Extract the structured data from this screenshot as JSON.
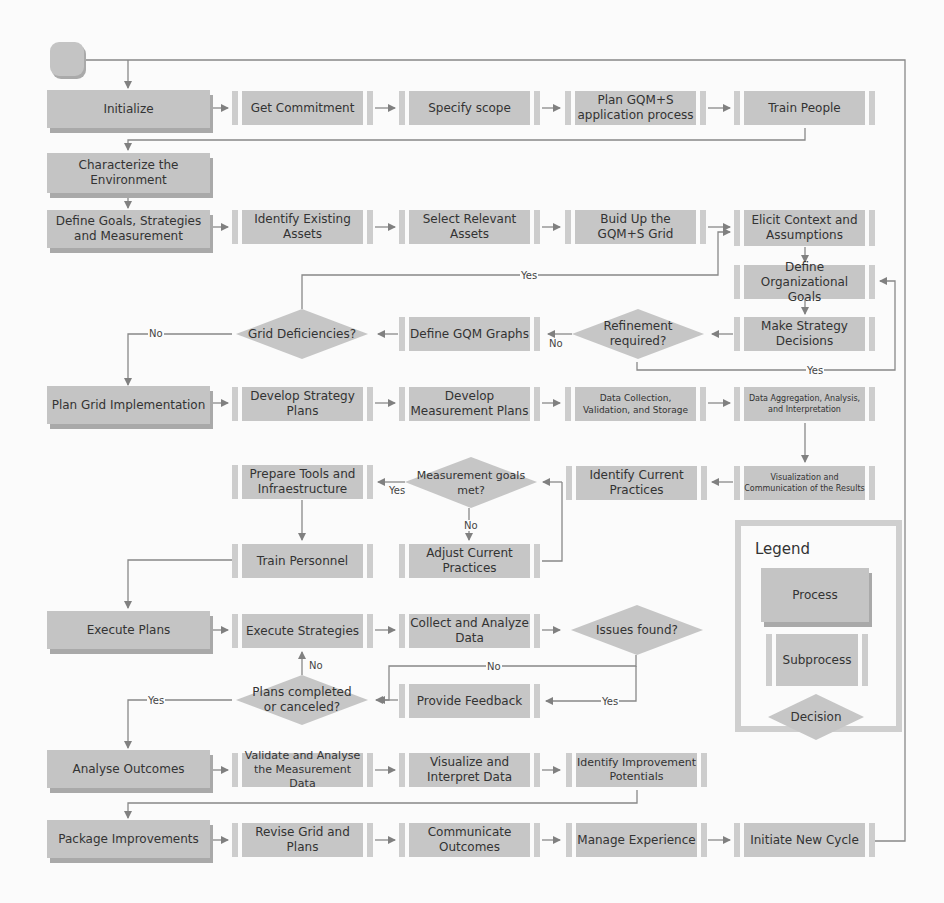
{
  "diagram": {
    "type": "flowchart"
  },
  "processes": {
    "initialize": "Initialize",
    "characterize": "Characterize the Environment",
    "define_goals": "Define Goals, Strategies and Measurement",
    "plan_grid": "Plan Grid Implementation",
    "execute_plans": "Execute Plans",
    "analyse_outcomes": "Analyse Outcomes",
    "package_improvements": "Package Improvements"
  },
  "subprocesses": {
    "get_commitment": "Get Commitment",
    "specify_scope": "Specify scope",
    "plan_gqm": "Plan GQM+S application process",
    "train_people": "Train People",
    "identify_assets": "Identify Existing Assets",
    "select_assets": "Select Relevant Assets",
    "build_grid": "Buid Up the GQM+S Grid",
    "elicit_context": "Elicit Context and Assumptions",
    "define_org_goals": "Define Organizational Goals",
    "make_strategy": "Make Strategy Decisions",
    "define_gqm_graphs": "Define GQM Graphs",
    "develop_strategy_plans": "Develop Strategy Plans",
    "develop_measurement_plans": "Develop Measurement Plans",
    "data_collection": "Data Collection, Validation, and Storage",
    "data_aggregation": "Data Aggregation, Analysis, and Interpretation",
    "visualization": "Visualization and Communication of the Results",
    "identify_practices": "Identify Current Practices",
    "prepare_tools": "Prepare Tools and Infraestructure",
    "train_personnel": "Train Personnel",
    "adjust_practices": "Adjust Current Practices",
    "execute_strategies": "Execute Strategies",
    "collect_analyze": "Collect and Analyze Data",
    "provide_feedback": "Provide Feedback",
    "validate_analyse": "Validate and Analyse the Measurement Data",
    "visualize_interpret": "Visualize and Interpret Data",
    "identify_improvement": "Identify Improvement Potentials",
    "revise_grid": "Revise Grid and Plans",
    "communicate_outcomes": "Communicate Outcomes",
    "manage_experience": "Manage Experience",
    "initiate_cycle": "Initiate New Cycle"
  },
  "decisions": {
    "grid_deficiencies": "Grid Deficiencies?",
    "refinement_required": "Refinement required?",
    "measurement_goals_met": "Measurement goals met?",
    "issues_found": "Issues found?",
    "plans_completed": "Plans completed or canceled?"
  },
  "edge_labels": {
    "yes": "Yes",
    "no": "No"
  },
  "legend": {
    "title": "Legend",
    "process": "Process",
    "subprocess": "Subprocess",
    "decision": "Decision"
  },
  "colors": {
    "box_fill": "#c4c4c4",
    "box_shadow": "#a9a9a9",
    "line": "#7a7a7a",
    "background": "#fbfbfb"
  }
}
